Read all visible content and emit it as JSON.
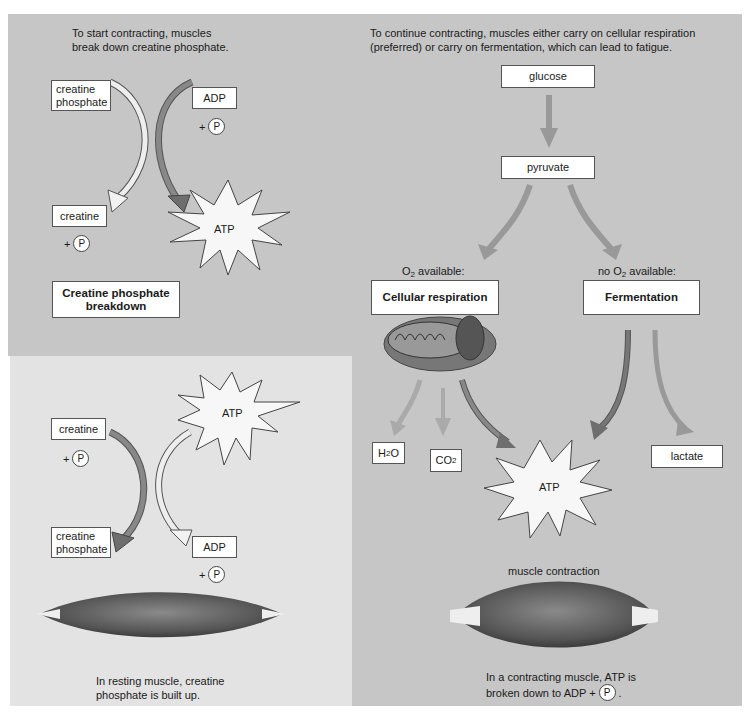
{
  "top_left": {
    "intro": "To start contracting, muscles break down creatine phosphate.",
    "creatine_phosphate": "creatine phosphate",
    "adp": "ADP",
    "plus": "+",
    "p": "P",
    "creatine": "creatine",
    "atp": "ATP",
    "title": "Creatine phosphate breakdown"
  },
  "bottom_left": {
    "creatine": "creatine",
    "plus": "+",
    "p": "P",
    "atp": "ATP",
    "creatine_phosphate": "creatine phosphate",
    "adp": "ADP",
    "caption": "In resting muscle, creatine phosphate is built up."
  },
  "right": {
    "intro": "To continue contracting, muscles either carry on cellular respiration (preferred) or carry on fermentation, which can lead to fatigue.",
    "glucose": "glucose",
    "pyruvate": "pyruvate",
    "o2_available": "O2 available:",
    "no_o2_available": "no O2 available:",
    "cellular_respiration": "Cellular respiration",
    "fermentation": "Fermentation",
    "h2o": "H2O",
    "co2": "CO2",
    "atp": "ATP",
    "lactate": "lactate",
    "muscle_contraction": "muscle contraction",
    "caption_line1": "In a contracting muscle, ATP is",
    "caption_line2": "broken down to ADP +",
    "p": "P"
  },
  "colors": {
    "panel_gray": "#c6c6c6",
    "panel_light": "#e3e3e3",
    "box_fill": "#ffffff",
    "arrow_dark": "#6e6e6e",
    "arrow_light": "#f2f2f2"
  }
}
